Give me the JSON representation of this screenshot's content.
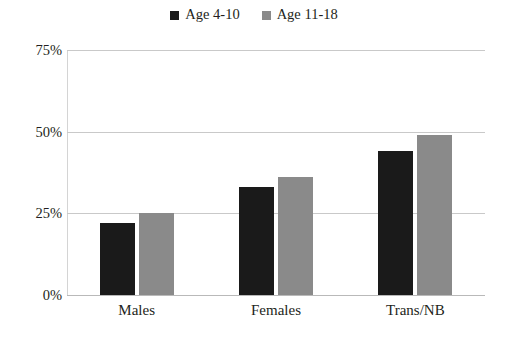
{
  "chart_data": {
    "type": "bar",
    "title": "",
    "subtitle": "",
    "xlabel": "",
    "ylabel": "",
    "categories": [
      "Males",
      "Females",
      "Trans/NB"
    ],
    "series": [
      {
        "name": "Age 4-10",
        "color": "#1a1a1a",
        "values": [
          22,
          33,
          44
        ]
      },
      {
        "name": "Age 11-18",
        "color": "#8a8a8a",
        "values": [
          25,
          36,
          49
        ]
      }
    ],
    "ylim": [
      0,
      75
    ],
    "yticks": [
      0,
      25,
      50,
      75
    ],
    "ytick_labels": [
      "0%",
      "25%",
      "50%",
      "75%"
    ],
    "value_suffix": "%",
    "grid": "horizontal",
    "legend_position": "top-center",
    "annotations": []
  },
  "legend": {
    "entries": [
      {
        "label": "Age 4-10",
        "swatch_color": "#1a1a1a"
      },
      {
        "label": "Age 11-18",
        "swatch_color": "#8a8a8a"
      }
    ]
  },
  "colors": {
    "background": "#ffffff",
    "text": "#231f20",
    "gridline": "#c9c9c9",
    "axis": "#d4d4d4",
    "baseline": "#b9b9b9",
    "series_dark": "#1a1a1a",
    "series_gray": "#8a8a8a"
  }
}
